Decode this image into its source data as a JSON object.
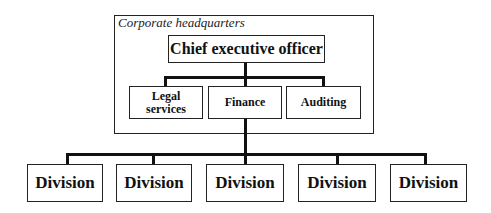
{
  "diagram": {
    "type": "org-chart",
    "container": {
      "label": "Corporate headquarters"
    },
    "ceo": {
      "label": "Chief executive officer"
    },
    "staff": [
      {
        "label": "Legal\nservices"
      },
      {
        "label": "Finance"
      },
      {
        "label": "Auditing"
      }
    ],
    "divisions": [
      {
        "label": "Division"
      },
      {
        "label": "Division"
      },
      {
        "label": "Division"
      },
      {
        "label": "Division"
      },
      {
        "label": "Division"
      }
    ]
  }
}
